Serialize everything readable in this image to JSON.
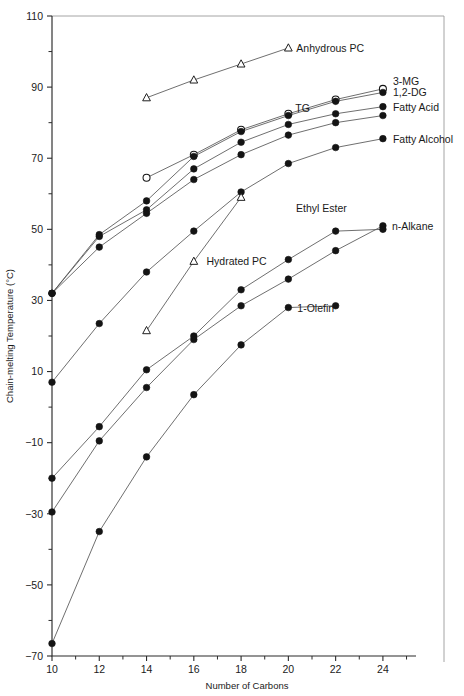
{
  "chart_data": {
    "type": "line",
    "title": "",
    "xlabel": "Number of Carbons",
    "ylabel": "Chain-melting Temperature (°C)",
    "xlim": [
      10,
      25.4
    ],
    "ylim": [
      -70,
      110
    ],
    "grid": false,
    "legend_position": "inline-right",
    "x_ticks": [
      10,
      12,
      14,
      16,
      18,
      20,
      22,
      24
    ],
    "x_tick_labels": [
      "10",
      "12",
      "14",
      "16",
      "18",
      "20",
      "22",
      "24"
    ],
    "x_minor_ticks": [
      11,
      13,
      15,
      17,
      19,
      21,
      23,
      25
    ],
    "y_ticks": [
      110,
      90,
      70,
      50,
      30,
      10,
      -10,
      -30,
      -50,
      -70
    ],
    "y_tick_labels": [
      "110",
      "90",
      "70",
      "50",
      "30",
      "10",
      "−10",
      "−30",
      "−50",
      "−70"
    ],
    "y_minor_ticks": [
      100,
      80,
      60,
      40,
      20,
      0,
      -20,
      -40,
      -60
    ],
    "series": [
      {
        "name": "Anhydrous PC",
        "marker": "triangle-open",
        "label": "Anhydrous PC",
        "label_x": 20.0,
        "label_y": 101.0,
        "label_dx": 8,
        "label_dy": 4,
        "label_anchor": "start",
        "x": [
          14,
          16,
          18,
          20
        ],
        "values": [
          87.0,
          92.0,
          96.5,
          101.0
        ]
      },
      {
        "name": "3-MG",
        "marker": "circle-open",
        "label": "3-MG",
        "label_x": 24.0,
        "label_y": 89.5,
        "label_dx": 10,
        "label_dy": -4,
        "label_anchor": "start",
        "x": [
          14,
          16,
          18,
          20,
          22,
          24
        ],
        "values": [
          64.5,
          71.0,
          78.0,
          82.5,
          86.5,
          89.5
        ]
      },
      {
        "name": "1,2-DG",
        "marker": "circle-filled",
        "label": "1,2-DG",
        "label_x": 24.0,
        "label_y": 88.5,
        "label_dx": 10,
        "label_dy": 4,
        "label_anchor": "start",
        "x": [
          10,
          12,
          14,
          16,
          18,
          20,
          22,
          24
        ],
        "values": [
          32.0,
          48.5,
          58.0,
          70.5,
          77.5,
          82.0,
          86.0,
          88.5
        ]
      },
      {
        "name": "Fatty Acid",
        "marker": "circle-filled",
        "label": "Fatty Acid",
        "label_x": 24.0,
        "label_y": 84.5,
        "label_dx": 10,
        "label_dy": 4,
        "label_anchor": "start",
        "x": [
          10,
          12,
          14,
          16,
          18,
          20,
          22,
          24
        ],
        "values": [
          32.0,
          48.0,
          55.5,
          67.0,
          74.5,
          79.5,
          82.5,
          84.5
        ]
      },
      {
        "name": "TG",
        "marker": "circle-filled",
        "label": "TG",
        "label_x": 20.6,
        "label_y": 83.0,
        "label_dx": 0,
        "label_dy": 0,
        "label_anchor": "middle",
        "x": [
          10,
          12,
          14,
          16,
          18,
          20,
          22,
          24
        ],
        "values": [
          32.0,
          45.0,
          54.5,
          64.0,
          71.0,
          76.5,
          80.0,
          82.0
        ]
      },
      {
        "name": "Fatty Alcohol",
        "marker": "circle-filled",
        "label": "Fatty Alcohol",
        "label_x": 24.0,
        "label_y": 75.5,
        "label_dx": 10,
        "label_dy": 4,
        "label_anchor": "start",
        "x": [
          10,
          12,
          14,
          16,
          18,
          20,
          22,
          24
        ],
        "values": [
          7.0,
          23.5,
          38.0,
          49.5,
          60.5,
          68.5,
          73.0,
          75.5
        ]
      },
      {
        "name": "Hydrated PC",
        "marker": "triangle-open",
        "label": "Hydrated PC",
        "label_x": 16.2,
        "label_y": 41.0,
        "label_dx": 8,
        "label_dy": 4,
        "label_anchor": "start",
        "x": [
          14,
          16,
          18
        ],
        "values": [
          21.5,
          41.0,
          59.0
        ]
      },
      {
        "name": "n-Alkane",
        "marker": "circle-filled",
        "label": "n-Alkane",
        "label_x": 24.0,
        "label_y": 51.0,
        "label_dx": 9,
        "label_dy": 4,
        "label_anchor": "start",
        "x": [
          10,
          12,
          14,
          16,
          18,
          20,
          22,
          24
        ],
        "values": [
          -29.5,
          -34.0,
          5.5,
          -0.5,
          28.5,
          36.0,
          44.0,
          51.0
        ]
      },
      {
        "name": "Ethyl Ester",
        "marker": "circle-filled",
        "label": "Ethyl Ester",
        "label_x": 21.4,
        "label_y": 55.0,
        "label_dx": 0,
        "label_dy": 0,
        "label_anchor": "middle",
        "x": [
          10,
          12,
          14,
          16,
          18,
          20,
          22,
          24
        ],
        "values": [
          -20.0,
          -5.5,
          10.5,
          20.0,
          33.0,
          41.5,
          49.5,
          50.0
        ]
      },
      {
        "name": "1-Olefin",
        "marker": "circle-filled",
        "label": "1-Olefin",
        "label_x": 20.0,
        "label_y": 28.0,
        "label_dx": 9,
        "label_dy": 4,
        "label_anchor": "start",
        "x": [
          10,
          12,
          14,
          16,
          18,
          20,
          22
        ],
        "values": [
          -66.5,
          -35.0,
          -14.0,
          3.5,
          17.5,
          28.0,
          28.5
        ]
      }
    ],
    "series_points_note": {
      "n-Alkane": [
        {
          "x": 10,
          "y": -29.5
        },
        {
          "x": 12,
          "y": -9.5
        },
        {
          "x": 14,
          "y": 5.5
        },
        {
          "x": 16,
          "y": 19.0
        },
        {
          "x": 18,
          "y": 28.5
        },
        {
          "x": 20,
          "y": 36.0
        },
        {
          "x": 22,
          "y": 44.0
        },
        {
          "x": 24,
          "y": 51.0
        }
      ]
    }
  }
}
